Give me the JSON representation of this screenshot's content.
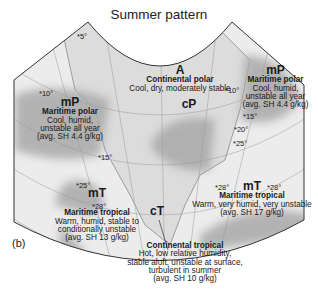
{
  "title": "Summer pattern",
  "panel_label": "(b)",
  "air_masses": [
    {
      "code": "A",
      "name": "Continental polar",
      "desc": [
        "Cool, dry, moderately stable"
      ]
    },
    {
      "code": "cP",
      "name": "",
      "desc": []
    },
    {
      "code": "mP",
      "name": "Maritime polar",
      "desc": [
        "Cool, humid,",
        "unstable all year",
        "(avg. SH 4.4 g/kg)"
      ]
    },
    {
      "code": "mP",
      "name": "Maritime polar",
      "desc": [
        "Cool, humid,",
        "unstable all year",
        "(avg. SH 4.4 g/kg)"
      ]
    },
    {
      "code": "mT",
      "name": "Maritime tropical",
      "desc": [
        "Warm, humid, stable to",
        "conditionally unstable",
        "(avg. SH 13 g/kg)"
      ]
    },
    {
      "code": "mT",
      "name": "Maritime tropical",
      "desc": [
        "Warm, very humid, very unstable",
        "(avg. SH 17 g/kg)"
      ]
    },
    {
      "code": "cT",
      "name": "Continental tropical",
      "desc": [
        "Hot, low relative humidity,",
        "stable aloft, unstable at surface,",
        "turbulent in summer",
        "(avg. SH 10 g/kg)"
      ]
    }
  ],
  "temperatures": [
    "*5°",
    "*10°",
    "*15°",
    "*10°",
    "*15°",
    "*20°",
    "*25°",
    "*25°",
    "*28°",
    "*28°",
    "*28°"
  ],
  "colors": {
    "land": "#d9d9d9",
    "ocean": "#e8e8e8",
    "air_mass_shade": "#a8a8a8",
    "outline": "#333333"
  }
}
